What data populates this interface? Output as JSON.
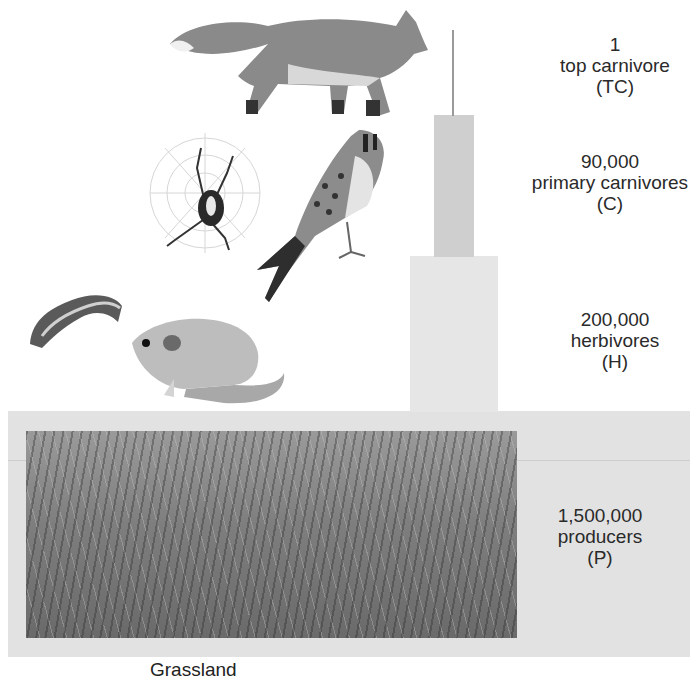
{
  "levels": [
    {
      "id": "tc",
      "count": "1",
      "name": "top carnivore",
      "abbr": "(TC)",
      "organisms": [
        "fox"
      ]
    },
    {
      "id": "c",
      "count": "90,000",
      "name": "primary carnivores",
      "abbr": "(C)",
      "organisms": [
        "spider",
        "kestrel"
      ]
    },
    {
      "id": "h",
      "count": "200,000",
      "name": "herbivores",
      "abbr": "(H)",
      "organisms": [
        "caterpillar",
        "mouse"
      ]
    },
    {
      "id": "p",
      "count": "1,500,000",
      "name": "producers",
      "abbr": "(P)",
      "organisms": [
        "grassland plants"
      ]
    }
  ],
  "caption": "Grassland",
  "colors": {
    "bar_c": "#cfcfcf",
    "bar_h": "#e6e6e6",
    "band_p": "#e2e2e2",
    "line_tc": "#9a9a9a"
  }
}
